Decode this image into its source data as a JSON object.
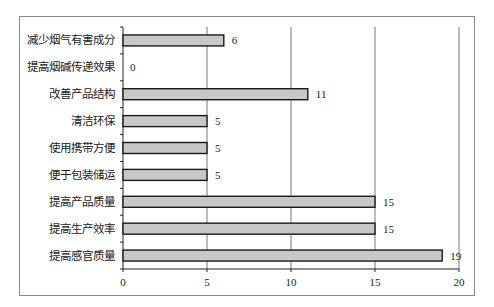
{
  "chart_data": {
    "type": "bar",
    "orientation": "horizontal",
    "title": "",
    "xlabel": "",
    "ylabel": "",
    "categories": [
      "减少烟气有害成分",
      "提高烟碱传递效果",
      "改善产品结构",
      "清洁环保",
      "使用携带方便",
      "便于包装储运",
      "提高产品质量",
      "提高生产效率",
      "提高感官质量"
    ],
    "values": [
      6,
      0,
      11,
      5,
      5,
      5,
      15,
      15,
      19
    ],
    "xlim": [
      0,
      20
    ],
    "xticks": [
      0,
      5,
      10,
      15,
      20
    ],
    "grid": {
      "vertical": true,
      "horizontal": false
    },
    "legend": null,
    "data_labels": true,
    "colors": {
      "bar_fill": "#c8c8c8",
      "bar_stroke": "#1a1a1a",
      "grid": "#555555",
      "frame": "#8a8a8a"
    }
  }
}
